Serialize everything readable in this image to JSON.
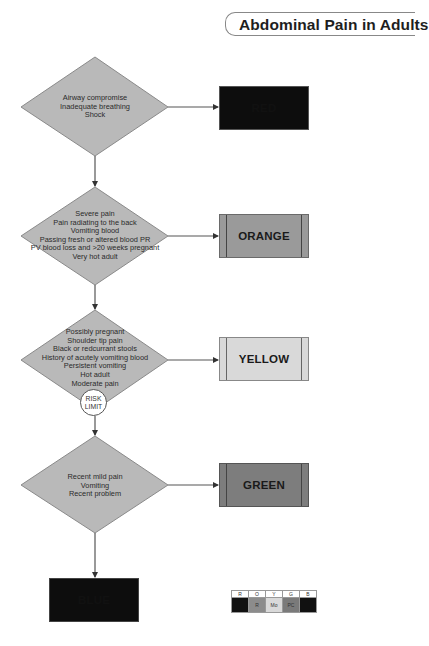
{
  "title": "Abdominal Pain in Adults",
  "nodes": [
    {
      "id": "d1",
      "lines": [
        "Airway compromise",
        "Inadequate breathing",
        "Shock"
      ],
      "outcome": {
        "label": "RED",
        "color": "#0d0d0d",
        "text_color": "#1a1a1a"
      }
    },
    {
      "id": "d2",
      "lines": [
        "Severe pain",
        "Pain radiating to the back",
        "Vomiting blood",
        "Passing fresh or altered blood PR",
        "PV blood loss and >20 weeks pregnant",
        "Very hot adult"
      ],
      "outcome": {
        "label": "ORANGE",
        "color": "#9a9a9a",
        "text_color": "#1a1a1a"
      }
    },
    {
      "id": "d3",
      "lines": [
        "Possibly pregnant",
        "Shoulder tip pain",
        "Black or redcurrant stools",
        "History of acutely vomiting blood",
        "Persistent vomiting",
        "Hot adult",
        "Moderate pain"
      ],
      "outcome": {
        "label": "YELLOW",
        "color": "#d9d9d9",
        "text_color": "#1a1a1a"
      },
      "risk_limit": {
        "line1": "RISK",
        "line2": "LIMIT"
      }
    },
    {
      "id": "d4",
      "lines": [
        "Recent mild pain",
        "Vomiting",
        "Recent problem"
      ],
      "outcome": {
        "label": "GREEN",
        "color": "#7d7d7d",
        "text_color": "#1a1a1a"
      }
    }
  ],
  "final_outcome": {
    "label": "BLUE",
    "color": "#0d0d0d"
  },
  "colors": {
    "diamond_fill": "#b9b9b9",
    "diamond_stroke": "#8a8a8a",
    "connector": "#555555"
  },
  "legend": {
    "headers": [
      "R",
      "O",
      "Y",
      "G",
      "B"
    ],
    "values": [
      "",
      "R",
      "Mo",
      "PC",
      ""
    ],
    "fills": [
      "#111111",
      "#8c8c8c",
      "#d9d9d9",
      "#7a7a7a",
      "#111111"
    ]
  }
}
